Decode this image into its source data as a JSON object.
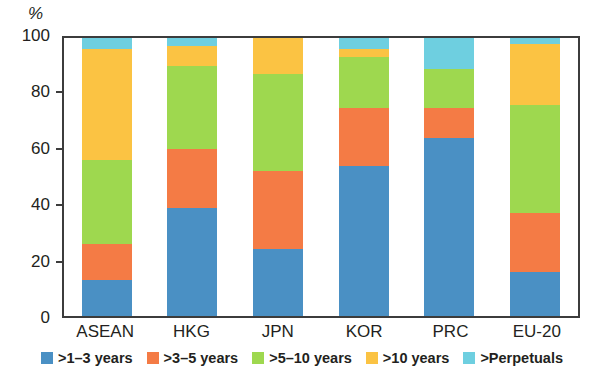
{
  "chart_data": {
    "type": "bar",
    "subtype": "stacked-100-percent",
    "title": "",
    "xlabel": "",
    "ylabel": "%",
    "ylim": [
      0,
      100
    ],
    "yticks": [
      0,
      20,
      40,
      60,
      80,
      100
    ],
    "grid": false,
    "legend_position": "bottom",
    "categories": [
      "ASEAN",
      "HKG",
      "JPN",
      "KOR",
      "PRC",
      "EU-20"
    ],
    "series": [
      {
        "name": ">1–3 years",
        "color": "#4a90c4",
        "values": [
          13,
          39,
          24,
          54,
          64,
          16
        ]
      },
      {
        "name": ">3–5 years",
        "color": "#f47b45",
        "values": [
          13,
          21,
          28,
          21,
          11,
          21
        ]
      },
      {
        "name": ">5–10 years",
        "color": "#9ed84f",
        "values": [
          30,
          30,
          35,
          18,
          14,
          39
        ]
      },
      {
        "name": ">10 years",
        "color": "#fbc343",
        "values": [
          40,
          7,
          13,
          3,
          0,
          22
        ]
      },
      {
        "name": ">Perpetuals",
        "color": "#6ecfe0",
        "values": [
          4,
          3,
          0,
          4,
          11,
          2
        ]
      }
    ],
    "cumulative_tops": {
      "ASEAN": [
        13,
        26,
        56,
        96,
        100
      ],
      "HKG": [
        39,
        60,
        90,
        97,
        100
      ],
      "JPN": [
        24,
        52,
        87,
        100,
        100
      ],
      "KOR": [
        54,
        75,
        93,
        96,
        100
      ],
      "PRC": [
        64,
        75,
        89,
        89,
        100
      ],
      "EU-20": [
        16,
        37,
        76,
        98,
        100
      ]
    }
  },
  "axis": {
    "unit": "%",
    "tick_labels": [
      "100",
      "80",
      "60",
      "40",
      "20",
      "0"
    ]
  },
  "legend": {
    "items": [
      {
        "label": ">1–3 years",
        "color": "#4a90c4"
      },
      {
        "label": ">3–5 years",
        "color": "#f47b45"
      },
      {
        "label": ">5–10 years",
        "color": "#9ed84f"
      },
      {
        "label": ">10 years",
        "color": "#fbc343"
      },
      {
        "label": ">Perpetuals",
        "color": "#6ecfe0"
      }
    ]
  }
}
